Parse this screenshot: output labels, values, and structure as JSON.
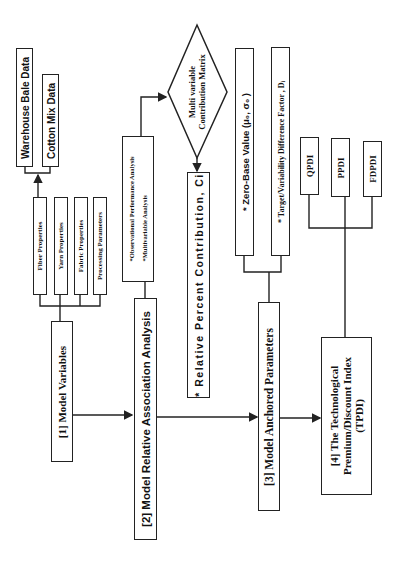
{
  "diagram": {
    "data_sources": [
      {
        "label": "Warehouse Bale Data"
      },
      {
        "label": "Cotton Mix Data"
      }
    ],
    "property_groups": [
      {
        "label": "Fiber Properties"
      },
      {
        "label": "Yarn Properties"
      },
      {
        "label": "Fabric Properties"
      },
      {
        "label": "Processing Parameters"
      }
    ],
    "step1": {
      "label": "[1] Model  Variables"
    },
    "analysis_methods": {
      "item1": "*Observational  Performance Analysis",
      "item2": "*Multivariable Analysis"
    },
    "step2": {
      "label": "[2] Model Relative Association Analysis"
    },
    "decision": {
      "line1": "Multi  variable",
      "line2": "Contribution Matrix"
    },
    "relative_contribution": {
      "label": "* Relative Percent Contribution, Ci"
    },
    "anchored_items": [
      {
        "label": "* Zero-Base Value (μ₀, σ₀ )"
      },
      {
        "label": "* Target/Variability Difference Factor , Dᵢ"
      }
    ],
    "step3": {
      "label": "[3] Model Anchored Parameters"
    },
    "indices": [
      {
        "label": "QPDI"
      },
      {
        "label": "PPDI"
      },
      {
        "label": "FDPDI"
      }
    ],
    "step4": {
      "line1": "[4] The Technological",
      "line2": "Premium/Discount Index",
      "line3": "(TPDI)"
    }
  }
}
